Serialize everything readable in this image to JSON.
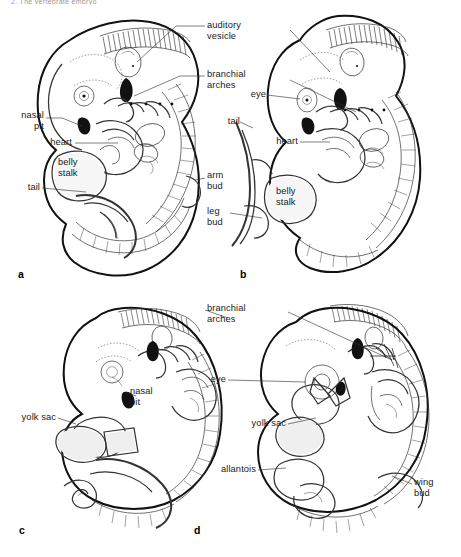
{
  "figure": {
    "top_caption_partial": "2.  The vertebrate embryo",
    "type": "scientific-illustration",
    "panel_count": 4
  },
  "panels": [
    {
      "id": "a",
      "letter": "a",
      "labels": [
        {
          "name": "nasal-pit",
          "text": "nasal\npit"
        },
        {
          "name": "heart",
          "text": "heart"
        },
        {
          "name": "belly-stalk",
          "text": "belly\nstalk"
        },
        {
          "name": "tail",
          "text": "tail"
        }
      ]
    },
    {
      "id": "b",
      "letter": "b",
      "labels": [
        {
          "name": "tail",
          "text": "tail"
        },
        {
          "name": "heart",
          "text": "heart"
        },
        {
          "name": "belly-stalk",
          "text": "belly\nstalk"
        },
        {
          "name": "arm-bud",
          "text": "arm\nbud"
        },
        {
          "name": "leg-bud",
          "text": "leg\nbud"
        },
        {
          "name": "eye",
          "text": "eye"
        }
      ]
    },
    {
      "id": "c",
      "letter": "c",
      "labels": [
        {
          "name": "yolk-sac",
          "text": "yolk sac"
        },
        {
          "name": "nasal-pit",
          "text": "nasal\npit"
        }
      ]
    },
    {
      "id": "d",
      "letter": "d",
      "labels": [
        {
          "name": "branchial-arches",
          "text": "branchial\narches"
        },
        {
          "name": "eye",
          "text": "eye"
        },
        {
          "name": "yolk-sac",
          "text": "yolk sac"
        },
        {
          "name": "allantois",
          "text": "allantois"
        },
        {
          "name": "wing-bud",
          "text": "wing\nbud"
        }
      ]
    }
  ],
  "shared_labels": [
    {
      "name": "auditory-vesicle",
      "text": "auditory\nvesicle"
    },
    {
      "name": "branchial-arches",
      "text": "branchial\narches"
    }
  ],
  "colors": {
    "ink": "#111111",
    "leader_line": "#333333",
    "stipple": "#efefef",
    "page": "#ffffff",
    "caption_grey": "#9a9a9a"
  }
}
